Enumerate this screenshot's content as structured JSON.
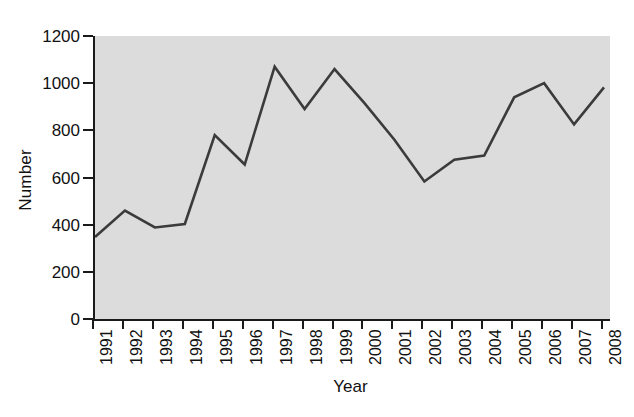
{
  "chart_data": {
    "type": "line",
    "title": "",
    "xlabel": "Year",
    "ylabel": "Number",
    "categories": [
      "1991",
      "1992",
      "1993",
      "1994",
      "1995",
      "1996",
      "1997",
      "1998",
      "1999",
      "2000",
      "2001",
      "2002",
      "2003",
      "2004",
      "2005",
      "2006",
      "2007",
      "2008"
    ],
    "values": [
      348,
      460,
      388,
      403,
      780,
      655,
      1070,
      890,
      1060,
      915,
      760,
      583,
      675,
      693,
      940,
      1000,
      825,
      982
    ],
    "series": [
      {
        "name": "Number",
        "values": [
          348,
          460,
          388,
          403,
          780,
          655,
          1070,
          890,
          1060,
          915,
          760,
          583,
          675,
          693,
          940,
          1000,
          825,
          982
        ]
      }
    ],
    "ylim": [
      0,
      1200
    ],
    "yticks": [
      0,
      200,
      400,
      600,
      800,
      1000,
      1200
    ],
    "ytick_labels": [
      "0",
      "200",
      "400",
      "600",
      "800",
      "1000",
      "1200"
    ],
    "xtick_labels": [
      "1991",
      "1992",
      "1993",
      "1994",
      "1995",
      "1996",
      "1997",
      "1998",
      "1999",
      "2000",
      "2001",
      "2002",
      "2003",
      "2004",
      "2005",
      "2006",
      "2007",
      "2008"
    ],
    "grid": false,
    "legend": false,
    "legend_position": "none",
    "line_color": "#3b3b3b",
    "plot_background": "#dcdcdc",
    "axis_color": "#1a1a1a",
    "figure_background": "#ffffff"
  }
}
